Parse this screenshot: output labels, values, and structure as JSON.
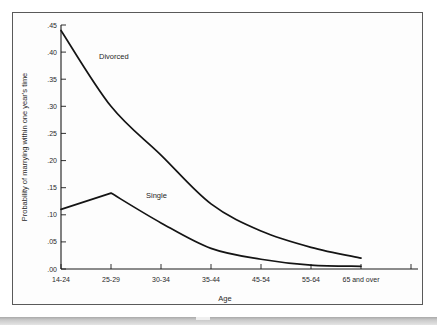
{
  "figure": {
    "background_color": "#fdfdfd",
    "border_color": "#5a5a5a",
    "line_color": "#141414"
  },
  "bottom_band": {
    "color_top": "#a9a9a9",
    "color_bottom": "#e4e4e4"
  },
  "chart_data": {
    "type": "line",
    "title": "",
    "xlabel": "Age",
    "ylabel": "Probability of marrying within one year's time",
    "categories": [
      "14-24",
      "25-29",
      "30-34",
      "35-44",
      "45-54",
      "55-64",
      "65 and over"
    ],
    "yticks": [
      ".00",
      ".05",
      ".10",
      ".15",
      ".20",
      ".25",
      ".30",
      ".35",
      ".40",
      ".45"
    ],
    "ytick_values": [
      0.0,
      0.05,
      0.1,
      0.15,
      0.2,
      0.25,
      0.3,
      0.35,
      0.4,
      0.45
    ],
    "ylim": [
      0.0,
      0.45
    ],
    "grid": false,
    "legend_position": "inline-annotation",
    "series": [
      {
        "name": "Divorced",
        "label": "Divorced",
        "values": [
          0.44,
          0.3,
          0.21,
          0.12,
          0.07,
          0.04,
          0.02
        ]
      },
      {
        "name": "Single",
        "label": "Single",
        "values": [
          0.11,
          0.14,
          0.085,
          0.038,
          0.018,
          0.007,
          0.005
        ]
      }
    ],
    "annotations": [
      {
        "text": "Divorced",
        "x_category": "25-29",
        "y_value": 0.385
      },
      {
        "text": "Single",
        "x_category": "30-34",
        "y_value": 0.135
      }
    ]
  }
}
